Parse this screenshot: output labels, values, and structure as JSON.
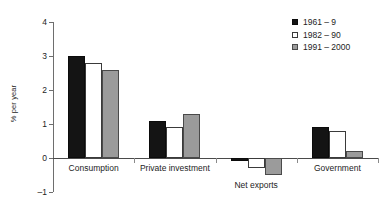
{
  "chart_data": {
    "type": "bar",
    "title": "",
    "subtitle": "",
    "xlabel": "",
    "ylabel": "% per year",
    "ylim": [
      -1,
      4
    ],
    "yticks": [
      "-1",
      "0",
      "1",
      "2",
      "3",
      "4"
    ],
    "grid": false,
    "legend_position": "top-right",
    "categories": [
      "Consumption",
      "Private investment",
      "Net exports",
      "Government"
    ],
    "series": [
      {
        "name": "1961 – 9",
        "color": "#141414",
        "values": [
          3.0,
          1.1,
          -0.1,
          0.9
        ]
      },
      {
        "name": "1982 – 90",
        "color": "#ffffff",
        "values": [
          2.8,
          0.9,
          -0.3,
          0.8
        ]
      },
      {
        "name": "1991 – 2000",
        "color": "#9b9b9b",
        "values": [
          2.6,
          1.3,
          -0.5,
          0.2
        ]
      }
    ],
    "annotations": []
  },
  "axis": {
    "zero_line_label": "0",
    "tick_color": "#6e6e6e"
  }
}
